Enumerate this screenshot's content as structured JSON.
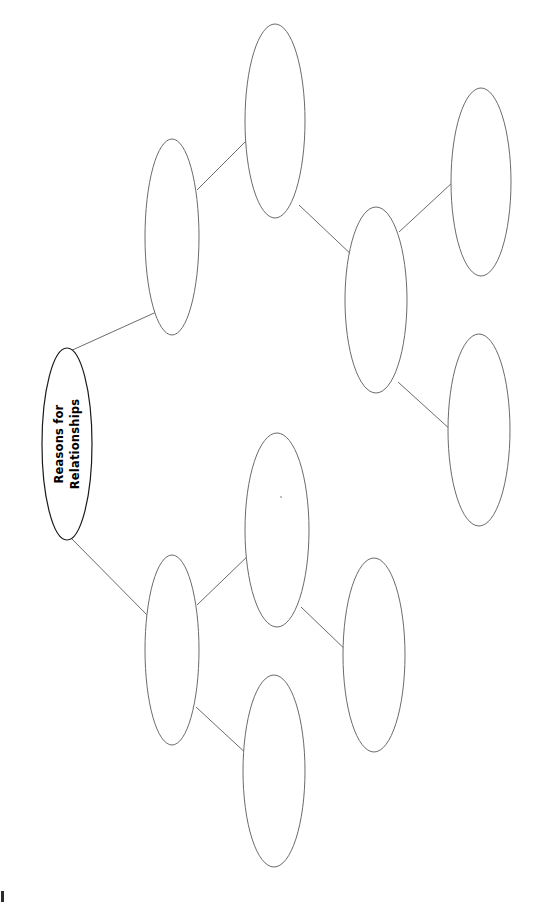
{
  "page": {
    "title": "Reasons for Relationships",
    "background_color": "#ffffff",
    "orientation": "rotated-90-landscape-content-on-portrait-page",
    "width": 534,
    "height": 906
  },
  "diagram": {
    "type": "tree-mind-map",
    "node_stroke_color": "#6b6b6b",
    "root_stroke_color": "#1a1a1a",
    "connector_color": "#6b6b6b",
    "text_rotation_degrees": -90,
    "nodes": [
      {
        "id": "root",
        "label": "Reasons for Relationships",
        "label_lines": [
          "Reasons for",
          "Relationships"
        ],
        "cx": 67,
        "cy": 444,
        "rx": 25,
        "ry": 96,
        "level": 0,
        "filled": true
      },
      {
        "id": "branch-upper",
        "label": "",
        "cx": 172,
        "cy": 237,
        "rx": 27,
        "ry": 98,
        "level": 1,
        "filled": false
      },
      {
        "id": "branch-lower",
        "label": "",
        "cx": 172,
        "cy": 650,
        "rx": 27,
        "ry": 95,
        "level": 1,
        "filled": false
      },
      {
        "id": "upper-child-top",
        "label": "",
        "cx": 275,
        "cy": 121,
        "rx": 30,
        "ry": 97,
        "level": 2,
        "filled": false
      },
      {
        "id": "upper-child-mid",
        "label": "",
        "cx": 376,
        "cy": 300,
        "rx": 31,
        "ry": 93,
        "level": 2,
        "filled": false
      },
      {
        "id": "upper-leaf-top",
        "label": "",
        "cx": 481,
        "cy": 182,
        "rx": 30,
        "ry": 94,
        "level": 3,
        "filled": false
      },
      {
        "id": "upper-leaf-bottom",
        "label": "",
        "cx": 479,
        "cy": 430,
        "rx": 31,
        "ry": 96,
        "level": 3,
        "filled": false
      },
      {
        "id": "lower-child-upper",
        "label": "",
        "cx": 277,
        "cy": 530,
        "rx": 32,
        "ry": 97,
        "level": 2,
        "filled": false
      },
      {
        "id": "lower-child-bottom",
        "label": "",
        "cx": 274,
        "cy": 771,
        "rx": 31,
        "ry": 96,
        "level": 2,
        "filled": false
      },
      {
        "id": "lower-leaf",
        "label": "",
        "cx": 374,
        "cy": 655,
        "rx": 31,
        "ry": 97,
        "level": 3,
        "filled": false
      }
    ],
    "connectors": [
      {
        "id": "root-to-branch-upper",
        "from": "root",
        "to": "branch-upper",
        "x1": 68,
        "y1": 352,
        "x2": 163,
        "y2": 309
      },
      {
        "id": "root-to-branch-lower",
        "from": "root",
        "to": "branch-lower",
        "x1": 70,
        "y1": 537,
        "x2": 152,
        "y2": 620
      },
      {
        "id": "branch-upper-to-child-top",
        "from": "branch-upper",
        "to": "upper-child-top",
        "x1": 197,
        "y1": 190,
        "x2": 252,
        "y2": 135
      },
      {
        "id": "upper-child-top-to-child-mid",
        "from": "upper-child-top",
        "to": "upper-child-mid",
        "x1": 299,
        "y1": 205,
        "x2": 355,
        "y2": 258
      },
      {
        "id": "upper-child-mid-to-leaf-top",
        "from": "upper-child-mid",
        "to": "upper-leaf-top",
        "x1": 399,
        "y1": 232,
        "x2": 453,
        "y2": 182
      },
      {
        "id": "upper-child-mid-to-leaf-bottom",
        "from": "upper-child-mid",
        "to": "upper-leaf-bottom",
        "x1": 398,
        "y1": 382,
        "x2": 452,
        "y2": 431
      },
      {
        "id": "branch-lower-to-child-upper",
        "from": "branch-lower",
        "to": "lower-child-upper",
        "x1": 197,
        "y1": 605,
        "x2": 252,
        "y2": 552
      },
      {
        "id": "branch-lower-to-child-bottom",
        "from": "branch-lower",
        "to": "lower-child-bottom",
        "x1": 196,
        "y1": 707,
        "x2": 250,
        "y2": 757
      },
      {
        "id": "lower-child-upper-to-leaf",
        "from": "lower-child-upper",
        "to": "lower-leaf",
        "x1": 301,
        "y1": 607,
        "x2": 351,
        "y2": 655
      }
    ]
  },
  "artifacts": {
    "corner_mark": "page-edge-mark",
    "interior_speck": "faint-dot"
  }
}
